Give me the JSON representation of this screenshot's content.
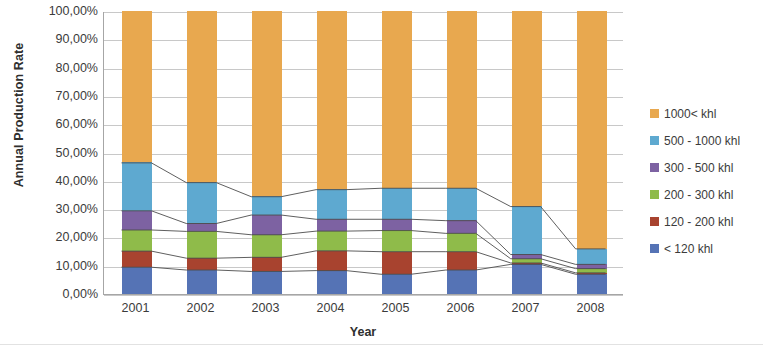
{
  "chart_data": {
    "type": "bar",
    "stacked": true,
    "stacked_mode": "percent",
    "title": "",
    "xlabel": "Year",
    "ylabel": "Annual Production Rate",
    "categories": [
      "2001",
      "2002",
      "2003",
      "2004",
      "2005",
      "2006",
      "2007",
      "2008"
    ],
    "ylim": [
      0,
      100
    ],
    "ytick_labels": [
      "100,00%",
      "90,00%",
      "80,00%",
      "70,00%",
      "60,00%",
      "50,00%",
      "40,00%",
      "30,00%",
      "20,00%",
      "10,00%",
      "0,00%"
    ],
    "ytick_values": [
      100,
      90,
      80,
      70,
      60,
      50,
      40,
      30,
      20,
      10,
      0
    ],
    "grid": true,
    "legend_position": "right",
    "series": [
      {
        "name": "1000< khl",
        "color": "#e8a84f",
        "values": [
          53.5,
          60.5,
          65.5,
          63.0,
          62.5,
          62.5,
          69.0,
          84.0
        ]
      },
      {
        "name": "500 - 1000 khl",
        "color": "#5ea9d0",
        "values": [
          17.0,
          14.5,
          6.5,
          10.5,
          11.0,
          11.5,
          17.0,
          5.5
        ]
      },
      {
        "name": "300 - 500 khl",
        "color": "#7d62a2",
        "values": [
          6.8,
          2.8,
          7.0,
          4.2,
          4.0,
          4.5,
          1.5,
          1.5
        ]
      },
      {
        "name": "200 - 300 khl",
        "color": "#8fbb4a",
        "values": [
          7.5,
          9.5,
          8.0,
          7.0,
          7.5,
          6.5,
          1.5,
          1.5
        ]
      },
      {
        "name": "120 - 200 khl",
        "color": "#a8432f",
        "values": [
          5.7,
          4.2,
          5.0,
          7.0,
          8.0,
          6.5,
          0.5,
          0.5
        ]
      },
      {
        "name": "< 120 khl",
        "color": "#5573b5",
        "values": [
          9.5,
          8.5,
          8.0,
          8.3,
          7.0,
          8.5,
          10.5,
          7.0
        ]
      }
    ],
    "cumulative_tops": [
      {
        "year": "2001",
        "tops": [
          100,
          46.5,
          29.5,
          22.7,
          15.2,
          9.5
        ]
      },
      {
        "year": "2002",
        "tops": [
          100,
          39.5,
          25.0,
          22.2,
          12.7,
          8.5
        ]
      },
      {
        "year": "2003",
        "tops": [
          100,
          34.5,
          28.0,
          21.0,
          13.0,
          8.0
        ]
      },
      {
        "year": "2004",
        "tops": [
          100,
          37.0,
          26.5,
          22.3,
          15.3,
          8.3
        ]
      },
      {
        "year": "2005",
        "tops": [
          100,
          37.5,
          26.5,
          22.5,
          15.0,
          7.0
        ]
      },
      {
        "year": "2006",
        "tops": [
          100,
          37.5,
          26.0,
          21.5,
          15.0,
          8.5
        ]
      },
      {
        "year": "2007",
        "tops": [
          100,
          31.0,
          14.0,
          12.5,
          11.0,
          10.5
        ]
      },
      {
        "year": "2008",
        "tops": [
          100,
          16.0,
          10.5,
          9.0,
          7.5,
          7.0
        ]
      }
    ]
  },
  "axes": {
    "y_title": "Annual Production Rate",
    "x_title": "Year"
  },
  "legend": {
    "items": [
      {
        "label": "1000< khl",
        "color": "#e8a84f"
      },
      {
        "label": "500 - 1000 khl",
        "color": "#5ea9d0"
      },
      {
        "label": "300 - 500 khl",
        "color": "#7d62a2"
      },
      {
        "label": "200 - 300 khl",
        "color": "#8fbb4a"
      },
      {
        "label": "120 - 200 khl",
        "color": "#a8432f"
      },
      {
        "label": "< 120 khl",
        "color": "#5573b5"
      }
    ]
  }
}
